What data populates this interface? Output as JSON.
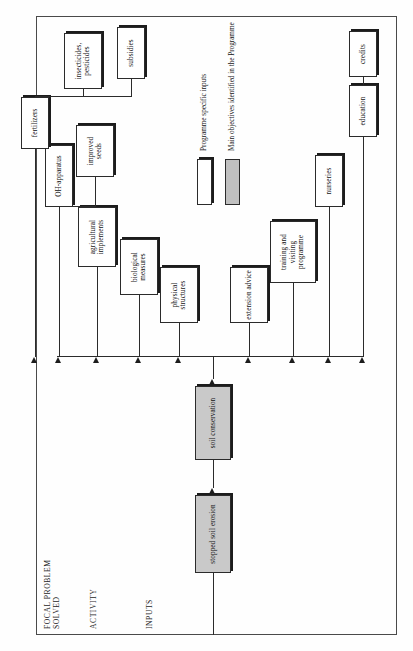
{
  "diagram": {
    "band_labels": [
      {
        "id": "focal",
        "text": "FOCAL PROBLEM\nSOLVED"
      },
      {
        "id": "activity",
        "text": "ACTIVITY"
      },
      {
        "id": "inputs",
        "text": "INPUTS"
      }
    ],
    "nodes": [
      {
        "id": "goal",
        "label": "stopped soil erosion",
        "style": "shaded"
      },
      {
        "id": "activity",
        "label": "soil conservation",
        "style": "shaded"
      },
      {
        "id": "physical",
        "label": "physical\nstructures",
        "style": "white"
      },
      {
        "id": "biological",
        "label": "biological\nmeasures",
        "style": "white"
      },
      {
        "id": "implements",
        "label": "agricultural\nimplements",
        "style": "white"
      },
      {
        "id": "ohapparatus",
        "label": "OH-apparatus",
        "style": "white"
      },
      {
        "id": "seeds",
        "label": "improved\nseeds",
        "style": "white"
      },
      {
        "id": "fertilizers",
        "label": "fertilizers",
        "style": "white"
      },
      {
        "id": "pesticides",
        "label": "insecticides,\npesticides",
        "style": "white"
      },
      {
        "id": "subsidies",
        "label": "subsidies",
        "style": "white"
      },
      {
        "id": "extension",
        "label": "extension\nadvice",
        "style": "white"
      },
      {
        "id": "training",
        "label": "training and\nvisiting\nprogramme",
        "style": "white"
      },
      {
        "id": "nurseries",
        "label": "nurseries",
        "style": "white"
      },
      {
        "id": "education",
        "label": "education",
        "style": "white"
      },
      {
        "id": "credits",
        "label": "credits",
        "style": "white"
      }
    ],
    "legend": {
      "items": [
        {
          "swatch": "white",
          "label": "Programme specific inputs"
        },
        {
          "swatch": "gray",
          "label": "Main objectives identified in the Programme"
        }
      ]
    },
    "colors": {
      "line": "#2b2b2b",
      "shaded_fill": "#c9c9c9",
      "white_fill": "#ffffff",
      "frame": "#4a4a4a"
    }
  }
}
